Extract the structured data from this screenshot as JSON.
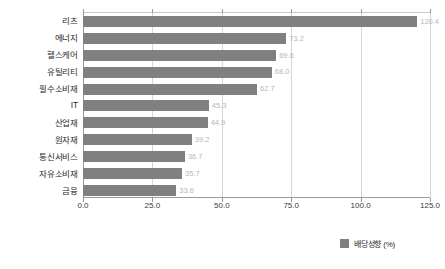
{
  "chart_data": {
    "type": "bar",
    "orientation": "horizontal",
    "title": "",
    "xlabel": "",
    "ylabel": "",
    "categories": [
      "리츠",
      "에너지",
      "헬스케어",
      "유틸리티",
      "필수소비재",
      "IT",
      "산업재",
      "원자재",
      "통신서비스",
      "자유소비재",
      "금융"
    ],
    "values": [
      120.4,
      73.2,
      69.6,
      68.0,
      62.7,
      45.3,
      44.9,
      39.2,
      36.7,
      35.7,
      33.6
    ],
    "value_labels": [
      "120.4",
      "73.2",
      "69.6",
      "68.0",
      "62.7",
      "45.3",
      "44.9",
      "39.2",
      "36.7",
      "35.7",
      "33.6"
    ],
    "xlim": [
      0.0,
      125.0
    ],
    "xticks": [
      0.0,
      25.0,
      50.0,
      75.0,
      100.0,
      125.0
    ],
    "xtick_labels": [
      "0.0",
      "25.0",
      "50.0",
      "75.0",
      "100.0",
      "125.0"
    ],
    "grid": true,
    "grid_axis": "x",
    "legend": {
      "position": "bottom-right",
      "entries": [
        {
          "label": "배당성향 (%)",
          "color": "#808080"
        }
      ]
    },
    "series": [
      {
        "name": "배당성향 (%)",
        "color": "#808080",
        "values": [
          120.4,
          73.2,
          69.6,
          68.0,
          62.7,
          45.3,
          44.9,
          39.2,
          36.7,
          35.7,
          33.6
        ]
      }
    ]
  },
  "colors": {
    "bar": "#808080",
    "value_label": "#b8b8b8",
    "axis": "#9a9a9a",
    "gridline": "#d6d6d6",
    "text": "#2b2b2b",
    "background": "#ffffff"
  }
}
